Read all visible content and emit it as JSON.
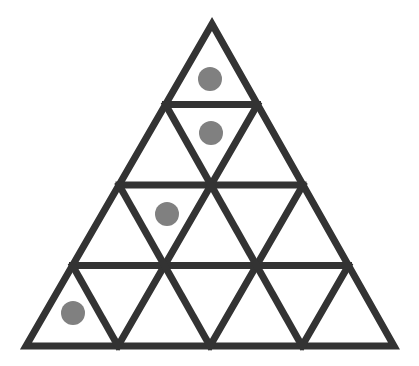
{
  "figure": {
    "type": "geometric-diagram",
    "background_color": "#ffffff",
    "canvas": {
      "width": 419,
      "height": 366
    }
  },
  "triangle": {
    "name": "outer-triangle",
    "apex": {
      "x": 212,
      "y": 24
    },
    "bottom_left": {
      "x": 26,
      "y": 346
    },
    "bottom_right": {
      "x": 394,
      "y": 346
    },
    "rows": 4,
    "small_triangle_count": 16,
    "upward_triangle_count": 10,
    "downward_triangle_count": 6,
    "stroke_color": "#333333",
    "stroke_width": 7,
    "fill_color": "#ffffff"
  },
  "grid_lines": {
    "horizontal": [
      {
        "name": "row1-row2-divider",
        "y": 104.5,
        "x1": 165.5,
        "x2": 258.5
      },
      {
        "name": "row2-row3-divider",
        "y": 185.0,
        "x1": 119.0,
        "x2": 305.0
      },
      {
        "name": "row3-row4-divider",
        "y": 265.5,
        "x1": 72.5,
        "x2": 351.5
      }
    ],
    "left_leaning_count": 3,
    "right_leaning_count": 3
  },
  "dots": [
    {
      "name": "dot-row1",
      "row": 1,
      "cell": "apex-triangle",
      "orientation": "up",
      "cx": 210,
      "cy": 79,
      "r": 12,
      "color": "#808080"
    },
    {
      "name": "dot-row2",
      "row": 2,
      "cell": "row2-upward-left",
      "orientation": "up",
      "cx": 211,
      "cy": 133,
      "r": 12,
      "color": "#808080"
    },
    {
      "name": "dot-row3",
      "row": 3,
      "cell": "row3-downward-left",
      "orientation": "down",
      "cx": 167,
      "cy": 214,
      "r": 12,
      "color": "#808080"
    },
    {
      "name": "dot-row4",
      "row": 4,
      "cell": "row4-upward-leftmost",
      "orientation": "up",
      "cx": 73,
      "cy": 313,
      "r": 12,
      "color": "#808080"
    }
  ],
  "counts": {
    "dot_total": 4
  }
}
